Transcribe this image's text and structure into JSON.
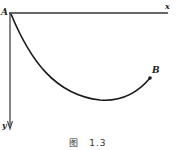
{
  "diagram": {
    "origin_label": "A",
    "end_label": "B",
    "x_axis_label": "x",
    "y_axis_label": "y",
    "caption": {
      "prefix": "图",
      "number": "1.3"
    },
    "stroke_color": "#1a1a1a",
    "axis_color": "#333333"
  }
}
